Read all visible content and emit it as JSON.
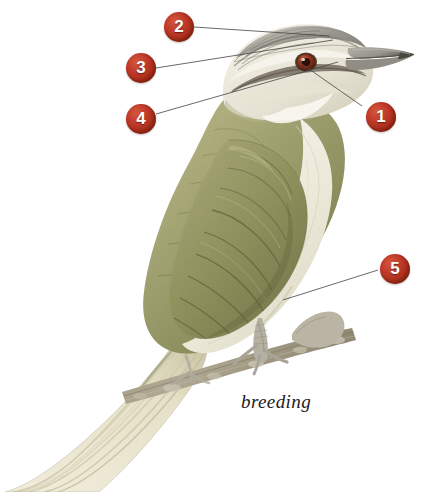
{
  "plate": {
    "subject": "Red-eyed Vireo",
    "caption": "breeding",
    "background_color": "#ffffff",
    "marker_color": "#c0392b",
    "marker_text_color": "#ffffff",
    "leader_line_color": "#4a4a4a"
  },
  "callouts": [
    {
      "id": "1",
      "label": "1",
      "x": 366,
      "y": 102,
      "target": "eye",
      "line": {
        "x1": 362,
        "y1": 106,
        "x2": 299,
        "y2": 62
      }
    },
    {
      "id": "2",
      "label": "2",
      "x": 164,
      "y": 12,
      "target": "crown",
      "line": {
        "x1": 194,
        "y1": 27,
        "x2": 330,
        "y2": 36
      }
    },
    {
      "id": "3",
      "label": "3",
      "x": 126,
      "y": 53,
      "target": "supercilium",
      "line": {
        "x1": 156,
        "y1": 68,
        "x2": 333,
        "y2": 40
      }
    },
    {
      "id": "4",
      "label": "4",
      "x": 126,
      "y": 104,
      "target": "eyeline",
      "line": {
        "x1": 156,
        "y1": 114,
        "x2": 338,
        "y2": 62
      }
    },
    {
      "id": "5",
      "label": "5",
      "x": 380,
      "y": 254,
      "target": "flanks",
      "line": {
        "x1": 378,
        "y1": 270,
        "x2": 283,
        "y2": 300
      }
    }
  ],
  "caption_position": {
    "x": 241,
    "y": 391
  },
  "palette": {
    "crown_gray": "#8e8c86",
    "crown_light": "#cfccc4",
    "supercilium_white": "#f3f1e9",
    "eyeline_dark": "#6b6257",
    "eye_red": "#8e3320",
    "bill_gray": "#9b9a92",
    "bill_tip_dark": "#4d4b45",
    "upperpart_olive": "#9a9a6e",
    "upperpart_olive_dark": "#7d7f55",
    "wing_olive": "#8a8c60",
    "underpart_cream": "#f4f2e6",
    "underpart_shadow": "#ddd9c6",
    "tail_cream": "#e9e4cd",
    "branch_brown": "#9b9079",
    "branch_gray": "#b9b5a8",
    "foot_gray": "#b5b2a6"
  }
}
